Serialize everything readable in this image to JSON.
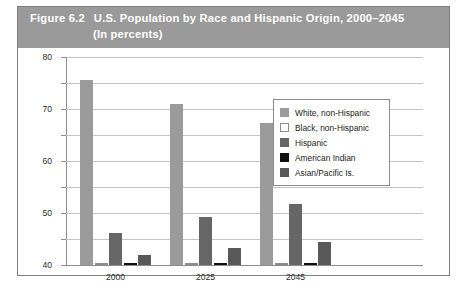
{
  "figure": {
    "label": "Figure 6.2",
    "title_line1": "U.S. Population by Race and Hispanic Origin, 2000–2045",
    "title_line2": "(In percents)",
    "header_bg": "#9a9a9a",
    "header_text_color": "#ffffff",
    "border_color": "#7d7d7d"
  },
  "chart_data": {
    "type": "bar",
    "title": "U.S. Population by Race and Hispanic Origin, 2000–2045",
    "subtitle": "(In percents)",
    "xlabel": "",
    "ylabel": "",
    "ylim": [
      0,
      80
    ],
    "yticks": [
      0,
      10,
      20,
      30,
      40,
      50,
      60,
      70,
      80
    ],
    "ytick_labels": [
      "0",
      "10",
      "20",
      "30",
      "40",
      "50",
      "60",
      "70",
      "80"
    ],
    "grid": true,
    "legend_position": "center-right",
    "categories": [
      "2000",
      "2025",
      "2045"
    ],
    "series": [
      {
        "name": "White, non-Hispanic",
        "color": "#9b9b9b",
        "values": [
          71.0,
          62.0,
          54.5
        ]
      },
      {
        "name": "Black, non-Hispanic",
        "color": "#ffffff",
        "values": [
          0.7,
          0.7,
          0.7
        ]
      },
      {
        "name": "Hispanic",
        "color": "#666666",
        "values": [
          12.5,
          18.5,
          23.5
        ]
      },
      {
        "name": "American Indian",
        "color": "#111111",
        "values": [
          0.9,
          0.9,
          0.9
        ]
      },
      {
        "name": "Asian/Pacific Is.",
        "color": "#595959",
        "values": [
          4.0,
          6.5,
          9.0
        ]
      }
    ]
  }
}
